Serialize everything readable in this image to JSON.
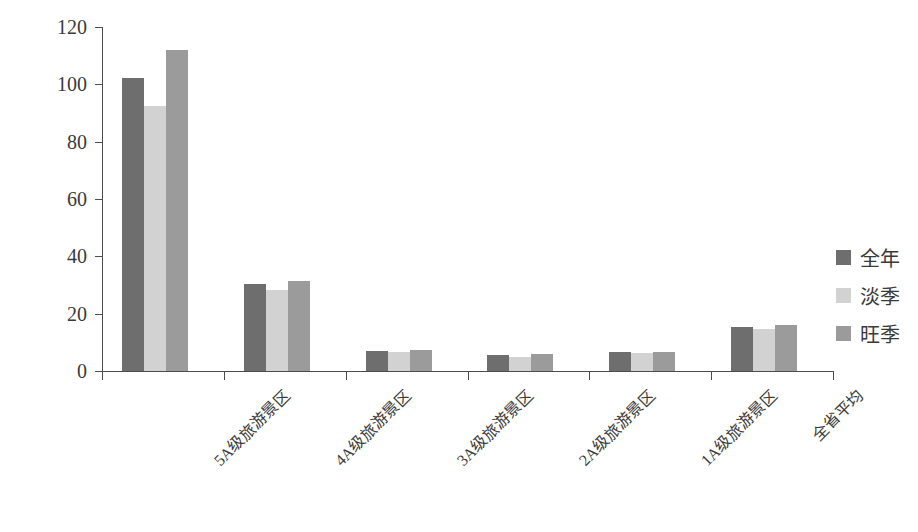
{
  "chart_data": {
    "type": "bar",
    "title": "",
    "subtitle": "",
    "xlabel": "",
    "ylabel": "平均门票价格（元/景区）",
    "ylim": [
      0,
      120
    ],
    "y_ticks": [
      0,
      20,
      40,
      60,
      80,
      100,
      120
    ],
    "grid": false,
    "legend_position": "right",
    "categories": [
      "5A级旅游景区",
      "4A级旅游景区",
      "3A级旅游景区",
      "2A级旅游景区",
      "1A级旅游景区",
      "全省平均"
    ],
    "series": [
      {
        "name": "全年",
        "color": "#6e6e6e",
        "values": [
          102.2,
          30.4,
          7.0,
          5.6,
          6.5,
          15.3
        ]
      },
      {
        "name": "淡季",
        "color": "#d2d2d2",
        "values": [
          92.3,
          28.4,
          6.7,
          4.8,
          6.4,
          14.6
        ]
      },
      {
        "name": "旺季",
        "color": "#9b9b9b",
        "values": [
          112.0,
          31.5,
          7.3,
          6.0,
          6.5,
          16.2
        ]
      }
    ]
  },
  "axis": {
    "y_title": "平均门票价格（元/景区）",
    "tick_labels": [
      "120",
      "100",
      "80",
      "60",
      "40",
      "20",
      "0"
    ]
  },
  "legend": {
    "items": [
      {
        "label": "全年",
        "color": "#6e6e6e"
      },
      {
        "label": "淡季",
        "color": "#d2d2d2"
      },
      {
        "label": "旺季",
        "color": "#9b9b9b"
      }
    ]
  }
}
